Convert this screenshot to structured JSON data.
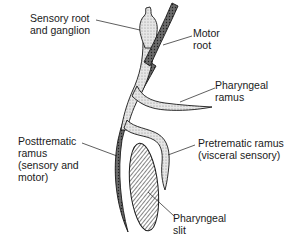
{
  "diagram": {
    "type": "anatomical nerve diagram",
    "colors": {
      "outline": "#1a1a1a",
      "stipple_fill": "#d9d9d9",
      "motor_fill": "#555555",
      "background": "#ffffff"
    },
    "labels": {
      "sensory_root": [
        "Sensory root",
        "and ganglion"
      ],
      "motor_root": [
        "Motor",
        "root"
      ],
      "pharyngeal_ramus": [
        "Pharyngeal",
        "ramus"
      ],
      "posttrematic_ramus": [
        "Posttrematic",
        "ramus",
        "(sensory and",
        "motor)"
      ],
      "pretrematic_ramus": [
        "Pretrematic ramus",
        "(visceral sensory)"
      ],
      "pharyngeal_slit": [
        "Pharyngeal",
        "slit"
      ]
    }
  }
}
